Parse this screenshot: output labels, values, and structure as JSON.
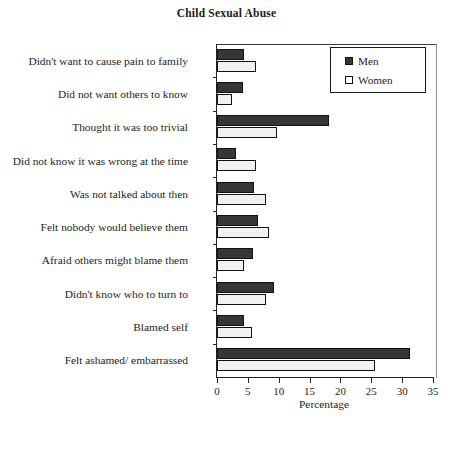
{
  "chart_data": {
    "type": "bar",
    "orientation": "horizontal",
    "title": "Child Sexual Abuse",
    "xlabel": "Percentage",
    "ylabel": "",
    "xlim": [
      0,
      35
    ],
    "xticks": [
      0,
      5,
      10,
      15,
      20,
      25,
      30,
      35
    ],
    "grid": false,
    "legend_position": "top-right",
    "categories": [
      "Didn't want to cause pain to family",
      "Did not want others to know",
      "Thought it was too trivial",
      "Did not know it was wrong at the time",
      "Was not talked about then",
      "Felt nobody would believe them",
      "Afraid others might blame them",
      "Didn't know who to turn to",
      "Blamed self",
      "Felt ashamed/ embarrassed"
    ],
    "series": [
      {
        "name": "Men",
        "color": "#363636",
        "values": [
          4.4,
          4.2,
          18.2,
          3.1,
          6.0,
          6.6,
          5.9,
          9.3,
          4.4,
          31.3
        ]
      },
      {
        "name": "Women",
        "color": "#f2f1ef",
        "values": [
          6.3,
          2.5,
          9.7,
          6.3,
          7.9,
          8.5,
          4.4,
          8.0,
          5.6,
          25.6
        ]
      }
    ]
  }
}
